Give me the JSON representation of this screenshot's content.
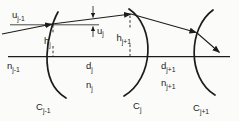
{
  "figure": {
    "colors": {
      "ink": "#1c1c1c",
      "paper": "#fbfbf9"
    }
  },
  "labels": {
    "u_prev": {
      "base": "u",
      "sub": "j-1"
    },
    "u_j": {
      "base": "u",
      "sub": "j"
    },
    "h_j": {
      "base": "h",
      "sub": "j"
    },
    "h_next": {
      "base": "h",
      "sub": "j+1"
    },
    "n_prev": {
      "base": "n",
      "sub": "j-1"
    },
    "d_j": {
      "base": "d",
      "sub": "j"
    },
    "n_j": {
      "base": "n",
      "sub": "j"
    },
    "d_next": {
      "base": "d",
      "sub": "j+1"
    },
    "n_next": {
      "base": "n",
      "sub": "j+1"
    },
    "c_prev": {
      "base": "C",
      "sub": "j-1"
    },
    "c_j": {
      "base": "C",
      "sub": "j"
    },
    "c_next": {
      "base": "C",
      "sub": "j+1"
    }
  }
}
